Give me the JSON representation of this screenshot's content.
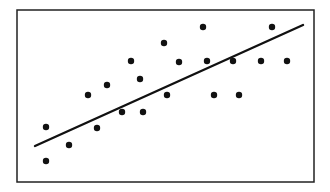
{
  "chart_data": {
    "type": "scatter",
    "title": "",
    "xlabel": "",
    "ylabel": "",
    "grid": false,
    "legend": null,
    "axes_ticks": "none",
    "frame": {
      "x": 17,
      "y": 10,
      "width": 297,
      "height": 172
    },
    "points": [
      {
        "x": 46,
        "y": 127
      },
      {
        "x": 46,
        "y": 161
      },
      {
        "x": 69,
        "y": 145
      },
      {
        "x": 88,
        "y": 95
      },
      {
        "x": 97,
        "y": 128
      },
      {
        "x": 107,
        "y": 85
      },
      {
        "x": 122,
        "y": 112
      },
      {
        "x": 131,
        "y": 61
      },
      {
        "x": 140,
        "y": 79
      },
      {
        "x": 143,
        "y": 112
      },
      {
        "x": 164,
        "y": 43
      },
      {
        "x": 167,
        "y": 95
      },
      {
        "x": 179,
        "y": 62
      },
      {
        "x": 203,
        "y": 27
      },
      {
        "x": 207,
        "y": 61
      },
      {
        "x": 214,
        "y": 95
      },
      {
        "x": 233,
        "y": 61
      },
      {
        "x": 239,
        "y": 95
      },
      {
        "x": 261,
        "y": 61
      },
      {
        "x": 272,
        "y": 27
      },
      {
        "x": 287,
        "y": 61
      }
    ],
    "trend_line": {
      "x1": 35,
      "y1": 146,
      "x2": 303,
      "y2": 25
    },
    "colors": {
      "points": "#111111",
      "line": "#111111",
      "frame": "#222222",
      "background": "#ffffff"
    },
    "point_radius": 3.2,
    "note": "Points in pixel coordinates; no axes/ticks/labels are shown. Positive linear trend."
  }
}
